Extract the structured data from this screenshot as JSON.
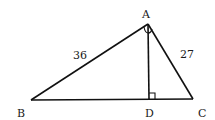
{
  "diagram": {
    "type": "right-triangle-with-altitude",
    "vertices": {
      "A": {
        "label": "A",
        "x": 148,
        "y": 24
      },
      "B": {
        "label": "B",
        "x": 31,
        "y": 100
      },
      "C": {
        "label": "C",
        "x": 193,
        "y": 99
      },
      "D": {
        "label": "D",
        "x": 149,
        "y": 99
      }
    },
    "side_labels": {
      "AB": "36",
      "AC": "27"
    },
    "right_angles": [
      "A",
      "D"
    ],
    "stroke_color": "#111111"
  }
}
